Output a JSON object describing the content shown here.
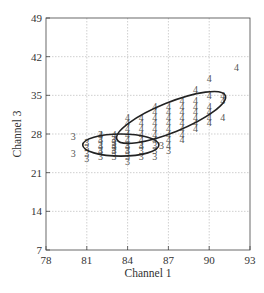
{
  "chart_data": {
    "type": "scatter",
    "title": "",
    "xlabel": "Channel 1",
    "ylabel": "Channel 3",
    "xlim": [
      78,
      93
    ],
    "ylim": [
      7,
      49
    ],
    "xticks": [
      78,
      81,
      84,
      87,
      90,
      93
    ],
    "yticks": [
      7,
      14,
      21,
      28,
      35,
      42,
      49
    ],
    "grid": true,
    "marker": "class label digit",
    "series": [
      {
        "name": "3",
        "points": [
          [
            80,
            27.5
          ],
          [
            80,
            24.5
          ],
          [
            81,
            26.5
          ],
          [
            81,
            25.5
          ],
          [
            81,
            24.5
          ],
          [
            81,
            23.5
          ],
          [
            82,
            28
          ],
          [
            82,
            27
          ],
          [
            82,
            26
          ],
          [
            82,
            25
          ],
          [
            82,
            24
          ],
          [
            83,
            27
          ],
          [
            83,
            26.5
          ],
          [
            83,
            26
          ],
          [
            83,
            25.5
          ],
          [
            83,
            25
          ],
          [
            83,
            24
          ],
          [
            84,
            26
          ],
          [
            84,
            25
          ],
          [
            84,
            24
          ],
          [
            84,
            23
          ],
          [
            85,
            26
          ],
          [
            85,
            25
          ],
          [
            85,
            24
          ],
          [
            86,
            26
          ],
          [
            86,
            25
          ],
          [
            86,
            24
          ],
          [
            86.5,
            26
          ],
          [
            87,
            25
          ]
        ],
        "ellipse": {
          "cx": 83.5,
          "cy": 26,
          "rx_units": 2.8,
          "ry_units": 2.0,
          "angle_deg": 0
        }
      },
      {
        "name": "4",
        "points": [
          [
            82,
            28
          ],
          [
            82,
            27
          ],
          [
            82,
            26
          ],
          [
            82,
            25
          ],
          [
            83,
            28
          ],
          [
            83,
            27
          ],
          [
            83,
            26
          ],
          [
            83,
            25
          ],
          [
            84,
            31
          ],
          [
            84,
            30
          ],
          [
            84,
            29
          ],
          [
            84,
            28
          ],
          [
            84,
            27
          ],
          [
            84,
            26
          ],
          [
            84,
            25
          ],
          [
            85,
            31
          ],
          [
            85,
            30
          ],
          [
            85,
            29
          ],
          [
            85,
            28
          ],
          [
            85,
            27
          ],
          [
            85,
            26
          ],
          [
            86,
            33
          ],
          [
            86,
            32
          ],
          [
            86,
            31
          ],
          [
            86,
            30
          ],
          [
            86,
            29
          ],
          [
            86,
            28
          ],
          [
            86,
            27
          ],
          [
            87,
            33
          ],
          [
            87,
            32
          ],
          [
            87,
            31
          ],
          [
            87,
            30
          ],
          [
            87,
            29
          ],
          [
            87,
            28
          ],
          [
            87,
            27
          ],
          [
            87,
            26
          ],
          [
            88,
            34
          ],
          [
            88,
            33
          ],
          [
            88,
            32
          ],
          [
            88,
            31
          ],
          [
            88,
            30
          ],
          [
            88,
            29
          ],
          [
            88,
            28
          ],
          [
            88,
            27
          ],
          [
            89,
            36
          ],
          [
            89,
            34
          ],
          [
            89,
            33
          ],
          [
            89,
            32
          ],
          [
            89,
            31
          ],
          [
            89,
            30
          ],
          [
            89,
            29
          ],
          [
            90,
            38
          ],
          [
            90,
            35
          ],
          [
            90,
            33
          ],
          [
            90,
            32
          ],
          [
            90,
            31
          ],
          [
            90,
            30
          ],
          [
            91,
            35
          ],
          [
            91,
            34
          ],
          [
            91,
            31
          ],
          [
            92,
            40
          ]
        ],
        "ellipse": {
          "cx": 87.2,
          "cy": 31,
          "rx_units": 4.3,
          "ry_units": 2.7,
          "angle_deg": -22
        }
      }
    ]
  }
}
